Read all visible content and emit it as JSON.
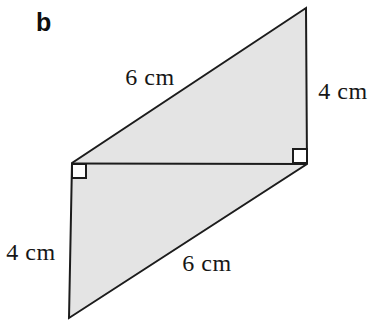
{
  "figure": {
    "part_label": "b",
    "shape": "parallelogram split by a diagonal into two congruent right triangles",
    "labels": {
      "top_side": "6 cm",
      "right_side": "4 cm",
      "left_side": "4 cm",
      "bottom_side": "6 cm"
    },
    "right_angle_markers": 2
  },
  "colors": {
    "background": "#ffffff",
    "shape_fill": "#e4e4e4",
    "line": "#1c1c1c",
    "right_angle_fill": "#ffffff",
    "text": "#161616"
  }
}
